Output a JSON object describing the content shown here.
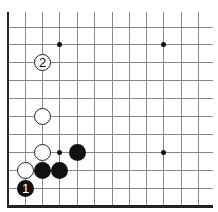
{
  "diagram": {
    "type": "go-board-corner",
    "colors": {
      "line": "#888888",
      "edge": "#222222",
      "black": "#111111",
      "white": "#ffffff"
    },
    "grid": {
      "columns_x": [
        8,
        25,
        42,
        59,
        77,
        94,
        112,
        129,
        146,
        163,
        181,
        198
      ],
      "rows_y": [
        27,
        44,
        62,
        80,
        98,
        116,
        134,
        152,
        170,
        188
      ],
      "top_y": 12,
      "right_x": 213,
      "bottom_edge_y": 206,
      "left_edge_x": 8
    },
    "star_points": [
      {
        "x": 59,
        "y": 44
      },
      {
        "x": 163,
        "y": 44
      },
      {
        "x": 59,
        "y": 152
      },
      {
        "x": 163,
        "y": 152
      }
    ],
    "stones": [
      {
        "color": "black",
        "x": 25,
        "y": 188,
        "label": "1"
      },
      {
        "color": "white",
        "x": 42,
        "y": 62,
        "label": "2"
      },
      {
        "color": "white",
        "x": 25,
        "y": 170,
        "label": ""
      },
      {
        "color": "black",
        "x": 42,
        "y": 170,
        "label": ""
      },
      {
        "color": "black",
        "x": 59,
        "y": 170,
        "label": ""
      },
      {
        "color": "white",
        "x": 42,
        "y": 152,
        "label": ""
      },
      {
        "color": "black",
        "x": 77,
        "y": 152,
        "label": ""
      },
      {
        "color": "white",
        "x": 42,
        "y": 116,
        "label": ""
      }
    ]
  }
}
